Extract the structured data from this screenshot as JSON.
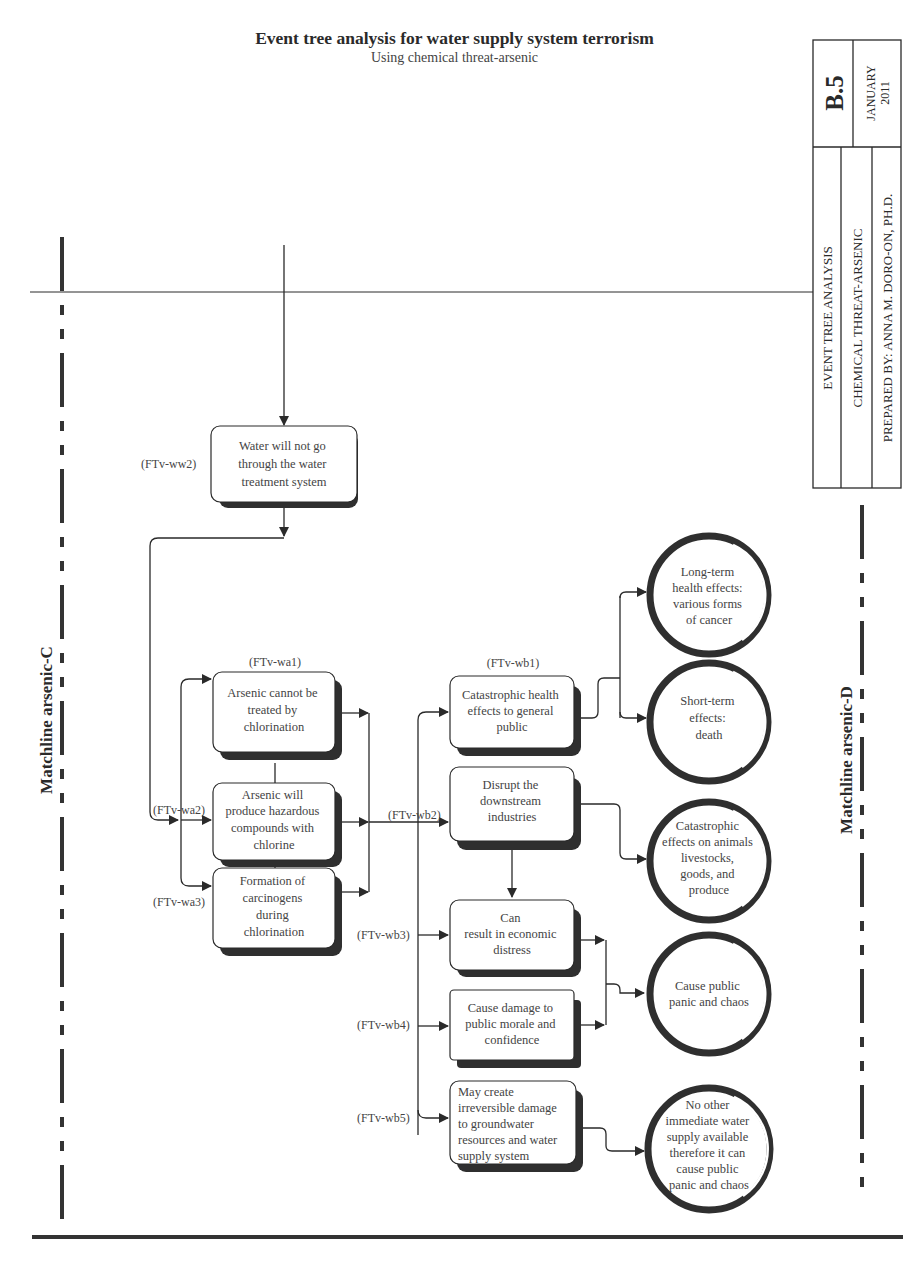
{
  "header": {
    "title": "Event tree analysis for water supply system terrorism",
    "subtitle": "Using chemical threat-arsenic"
  },
  "title_block": {
    "sheet_number": "B.5",
    "month": "JANUARY",
    "year": "2011",
    "row1": "EVENT TREE ANALYSIS",
    "row2": "CHEMICAL THREAT-ARSENIC",
    "row3": "PREPARED BY: ANNA M. DORO-ON, PH.D."
  },
  "matchlines": {
    "left": "Matchline arsenic-C",
    "right": "Matchline arsenic-D"
  },
  "nodes": {
    "ww2": {
      "code": "(FTv-ww2)",
      "lines": [
        "Water will not go",
        "through the water",
        "treatment system"
      ]
    },
    "wa1": {
      "code": "(FTv-wa1)",
      "lines": [
        "Arsenic cannot be",
        "treated by",
        "chlorination"
      ]
    },
    "wa2": {
      "code": "(FTv-wa2)",
      "lines": [
        "Arsenic will",
        "produce hazardous",
        "compounds with",
        "chlorine"
      ]
    },
    "wa3": {
      "code": "(FTv-wa3)",
      "lines": [
        "Formation of",
        "carcinogens",
        "during",
        "chlorination"
      ]
    },
    "wb1": {
      "code": "(FTv-wb1)",
      "lines": [
        "Catastrophic health",
        "effects to general",
        "public"
      ]
    },
    "wb2": {
      "code": "(FTv-wb2)",
      "lines": [
        "Disrupt the",
        "downstream",
        "industries"
      ]
    },
    "wb3": {
      "code": "(FTv-wb3)",
      "lines": [
        "Can",
        "result in economic",
        "distress"
      ]
    },
    "wb4": {
      "code": "(FTv-wb4)",
      "lines": [
        "Cause damage to",
        "public morale and",
        "confidence"
      ]
    },
    "wb5": {
      "code": "(FTv-wb5)",
      "lines": [
        "May create",
        "irreversible damage",
        "to groundwater",
        "resources and water",
        "supply system"
      ]
    }
  },
  "outcomes": {
    "o1": {
      "lines": [
        "Long-term",
        "health effects:",
        "various forms",
        "of cancer"
      ]
    },
    "o2": {
      "lines": [
        "Short-term",
        "effects:",
        "death"
      ]
    },
    "o3": {
      "lines": [
        "Catastrophic",
        "effects on animals",
        "livestocks,",
        "goods, and",
        "produce"
      ]
    },
    "o4": {
      "lines": [
        "Cause public",
        "panic and chaos"
      ]
    },
    "o5": {
      "lines": [
        "No other",
        "immediate water",
        "supply available",
        "therefore it can",
        "cause public",
        "panic and chaos"
      ]
    }
  },
  "colors": {
    "line": "#2a2a2a",
    "shadow": "#2f2f2f",
    "text": "#444444",
    "background": "#ffffff"
  }
}
